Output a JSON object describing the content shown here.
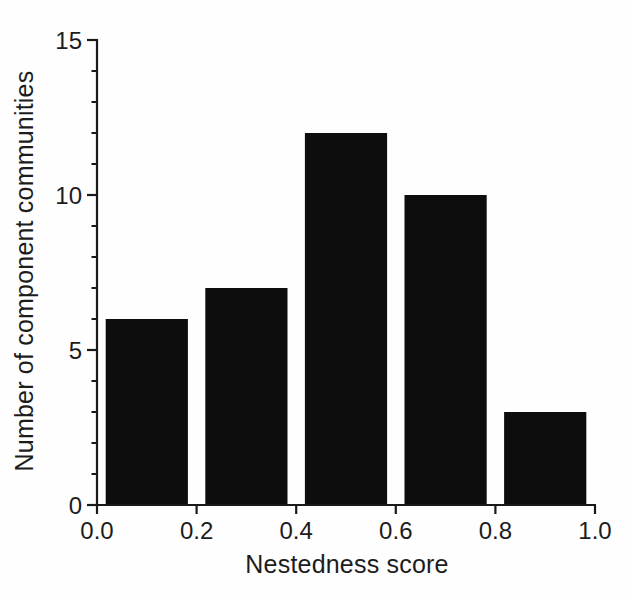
{
  "figure": {
    "background": "#fefefe"
  },
  "chart_data": {
    "type": "bar",
    "subtype": "histogram",
    "title": "",
    "xlabel": "Nestedness score",
    "ylabel": "Number of component communities",
    "categories": [
      "0.0-0.2",
      "0.2-0.4",
      "0.4-0.6",
      "0.6-0.8",
      "0.8-1.0"
    ],
    "bin_centers": [
      0.1,
      0.3,
      0.5,
      0.7,
      0.9
    ],
    "values": [
      6,
      7,
      12,
      10,
      3
    ],
    "bar_width_units": 0.165,
    "xlim": [
      0,
      1
    ],
    "ylim": [
      0,
      15
    ],
    "x_ticks": [
      0,
      0.2,
      0.4,
      0.6,
      0.8,
      1.0
    ],
    "x_tick_labels": [
      "0.0",
      "0.2",
      "0.4",
      "0.6",
      "0.8",
      "1.0"
    ],
    "y_major_ticks": [
      0,
      5,
      10,
      15
    ],
    "y_major_tick_labels": [
      "0",
      "5",
      "10",
      "15"
    ],
    "y_minor_tick_step": 1,
    "grid": false,
    "legend_position": "none",
    "bar_color": "#0d0d0d",
    "axis_color": "#191919",
    "text_color": "#1c1c1c"
  }
}
